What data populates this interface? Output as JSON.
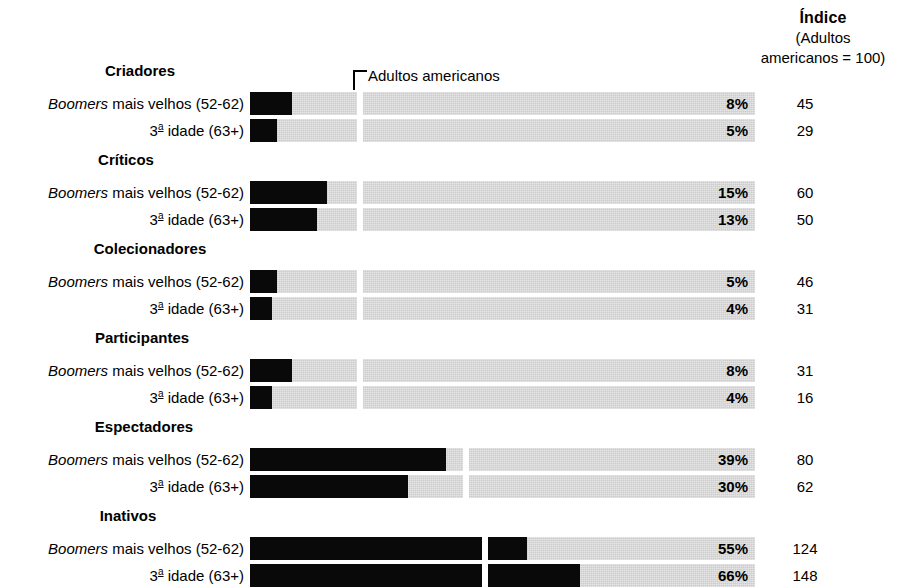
{
  "index_header": {
    "title": "Índice",
    "sub_line1": "(Adultos",
    "sub_line2": "americanos = 100)"
  },
  "reference": {
    "label": "Adultos americanos",
    "value": 100
  },
  "labels": {
    "boomers_prefix": "Boomers",
    "boomers_rest": " mais velhos (52-62)",
    "seniors_num": "3",
    "seniors_ord": "a",
    "seniors_rest": " idade (63+)"
  },
  "colors": {
    "bar_fill": "#090909",
    "bar_track": "#cdcdcd",
    "background": "#ffffff",
    "text": "#000000"
  },
  "chart_data": {
    "type": "bar",
    "title": "Índice (Adultos americanos = 100)",
    "xlabel": "",
    "ylabel": "",
    "xlim": [
      0,
      100
    ],
    "grid": false,
    "legend": "none",
    "reference_line": {
      "label": "Adultos americanos",
      "index_value": 100,
      "pixel_fraction": 0.212
    },
    "categories": [
      "Criadores",
      "Críticos",
      "Colecionadores",
      "Participantes",
      "Espectadores",
      "Inativos"
    ],
    "series": [
      {
        "name": "Boomers mais velhos (52-62)",
        "percent": [
          8,
          15,
          5,
          8,
          39,
          55
        ],
        "index": [
          45,
          60,
          46,
          31,
          80,
          124
        ]
      },
      {
        "name": "3a idade (63+)",
        "percent": [
          5,
          13,
          4,
          4,
          30,
          66
        ],
        "index": [
          29,
          50,
          31,
          16,
          62,
          148
        ]
      }
    ],
    "groups": [
      {
        "title": "Criadores",
        "title_left": 20,
        "title_top": 62,
        "rows": [
          {
            "label": "boomers",
            "top": 92,
            "percent": 8,
            "percent_label": "8%",
            "fill_px": 42,
            "index": "45",
            "gap_px": 107
          },
          {
            "label": "seniors",
            "top": 119,
            "percent": 5,
            "percent_label": "5%",
            "fill_px": 27,
            "index": "29",
            "gap_px": 107
          }
        ]
      },
      {
        "title": "Críticos",
        "title_left": 6,
        "title_top": 151,
        "rows": [
          {
            "label": "boomers",
            "top": 181,
            "percent": 15,
            "percent_label": "15%",
            "fill_px": 77,
            "index": "60",
            "gap_px": 107
          },
          {
            "label": "seniors",
            "top": 208,
            "percent": 13,
            "percent_label": "13%",
            "fill_px": 67,
            "index": "50",
            "gap_px": 107
          }
        ]
      },
      {
        "title": "Colecionadores",
        "title_left": 30,
        "title_top": 240,
        "rows": [
          {
            "label": "boomers",
            "top": 270,
            "percent": 5,
            "percent_label": "5%",
            "fill_px": 27,
            "index": "46",
            "gap_px": 107
          },
          {
            "label": "seniors",
            "top": 297,
            "percent": 4,
            "percent_label": "4%",
            "fill_px": 22,
            "index": "31",
            "gap_px": 107
          }
        ]
      },
      {
        "title": "Participantes",
        "title_left": 22,
        "title_top": 329,
        "rows": [
          {
            "label": "boomers",
            "top": 359,
            "percent": 8,
            "percent_label": "8%",
            "fill_px": 42,
            "index": "31",
            "gap_px": 107
          },
          {
            "label": "seniors",
            "top": 386,
            "percent": 4,
            "percent_label": "4%",
            "fill_px": 22,
            "index": "16",
            "gap_px": 107
          }
        ]
      },
      {
        "title": "Espectadores",
        "title_left": 24,
        "title_top": 418,
        "rows": [
          {
            "label": "boomers",
            "top": 448,
            "percent": 39,
            "percent_label": "39%",
            "fill_px": 196,
            "index": "80",
            "gap_px": 213
          },
          {
            "label": "seniors",
            "top": 475,
            "percent": 30,
            "percent_label": "30%",
            "fill_px": 158,
            "index": "62",
            "gap_px": 213
          }
        ]
      },
      {
        "title": "Inativos",
        "title_left": 8,
        "title_top": 507,
        "rows": [
          {
            "label": "boomers",
            "top": 537,
            "percent": 55,
            "percent_label": "55%",
            "fill_px": 277,
            "index": "124",
            "gap_px": 232
          },
          {
            "label": "seniors",
            "top": 564,
            "percent": 66,
            "percent_label": "66%",
            "fill_px": 330,
            "index": "148",
            "gap_px": 232
          }
        ]
      }
    ]
  }
}
